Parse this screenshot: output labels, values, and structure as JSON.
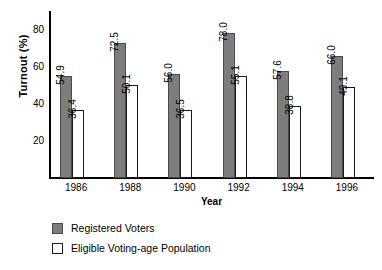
{
  "chart_data": {
    "type": "bar",
    "title": "",
    "xlabel": "Year",
    "ylabel": "Turnout (%)",
    "categories": [
      "1986",
      "1988",
      "1990",
      "1992",
      "1994",
      "1996"
    ],
    "yticks": [
      "20",
      "40",
      "60",
      "80"
    ],
    "ylim": [
      0,
      90
    ],
    "grid": false,
    "legend_position": "below-plot-left",
    "series": [
      {
        "name": "Registered Voters",
        "color": "#7d7d7d",
        "values": [
          54.9,
          72.5,
          56.0,
          78.0,
          57.6,
          66.0
        ],
        "labels": [
          "54.9",
          "72.5",
          "56.0",
          "78.0",
          "57.6",
          "66.0"
        ]
      },
      {
        "name": "Eligible Voting-age Population",
        "color": "#ffffff",
        "values": [
          36.4,
          50.1,
          36.5,
          55.1,
          38.8,
          49.1
        ],
        "labels": [
          "36.4",
          "50.1",
          "36.5",
          "55.1",
          "38.8",
          "49.1"
        ]
      }
    ]
  }
}
